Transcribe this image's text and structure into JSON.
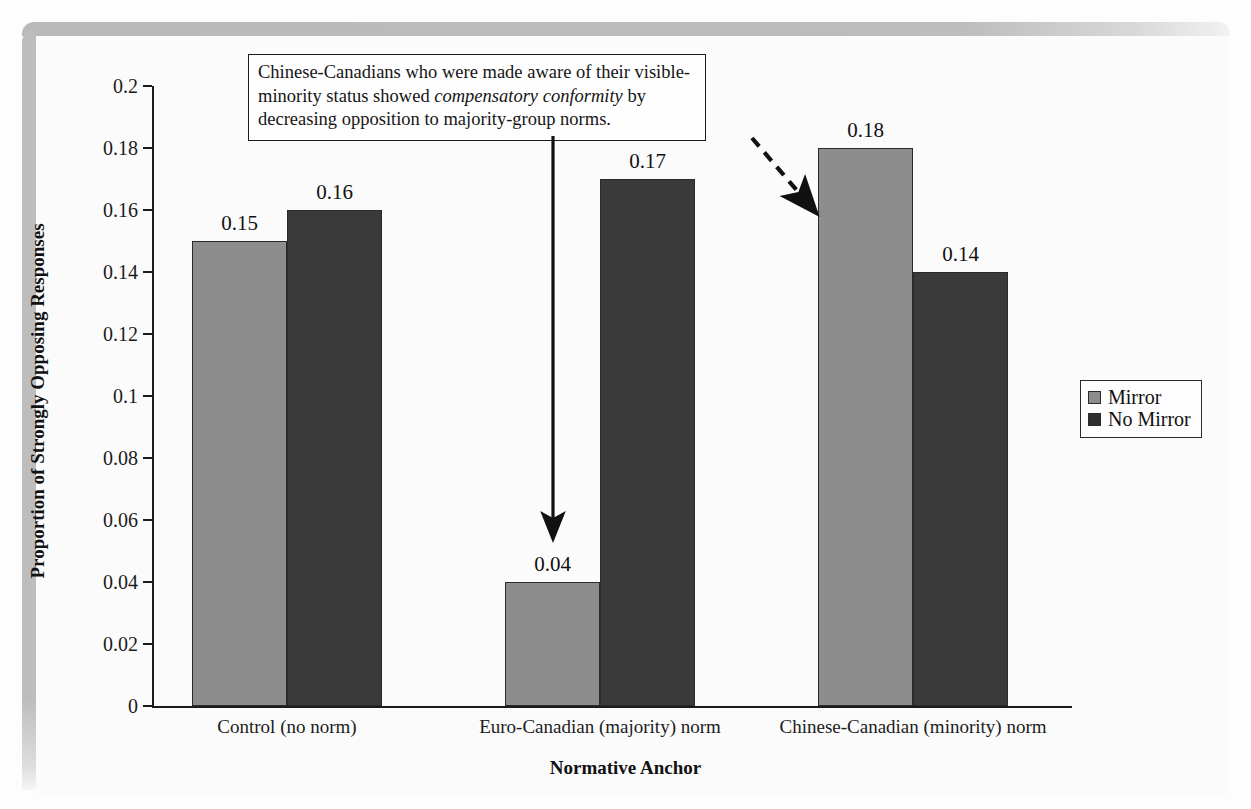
{
  "chart_data": {
    "type": "bar",
    "title": "",
    "xlabel": "Normative Anchor",
    "ylabel": "Proportion of Strongly Opposing Responses",
    "categories": [
      "Control (no norm)",
      "Euro-Canadian (majority) norm",
      "Chinese-Canadian (minority) norm"
    ],
    "series": [
      {
        "name": "Mirror",
        "color": "#8d8d8d",
        "values": [
          0.15,
          0.04,
          0.18
        ]
      },
      {
        "name": "No Mirror",
        "color": "#3a3a3a",
        "values": [
          0.16,
          0.17,
          0.14
        ]
      }
    ],
    "value_labels": [
      [
        "0.15",
        "0.16"
      ],
      [
        "0.04",
        "0.17"
      ],
      [
        "0.18",
        "0.14"
      ]
    ],
    "ylim": [
      0,
      0.2
    ],
    "ytick_values": [
      0,
      0.02,
      0.04,
      0.06,
      0.08,
      0.1,
      0.12,
      0.14,
      0.16,
      0.18,
      0.2
    ],
    "ytick_labels": [
      "0",
      "0.02",
      "0.04",
      "0.06",
      "0.08",
      "0.1",
      "0.12",
      "0.14",
      "0.16",
      "0.18",
      "0.2"
    ],
    "grid": false,
    "legend_position": "right"
  },
  "annotation": {
    "text_part_1": "Chinese-Canadians who were made aware of their visible-minority status showed ",
    "text_emphasis": "compensatory conformity",
    "text_part_2": " by decreasing opposition to majority-group norms."
  },
  "legend": {
    "items": [
      {
        "label": "Mirror"
      },
      {
        "label": "No Mirror"
      }
    ]
  },
  "axes": {
    "x_title": "Normative Anchor",
    "y_title": "Proportion of Strongly Opposing Responses"
  },
  "arrows": [
    {
      "name": "solid-down-arrow",
      "style": "solid"
    },
    {
      "name": "dashed-diagonal-arrow",
      "style": "dashed"
    }
  ]
}
